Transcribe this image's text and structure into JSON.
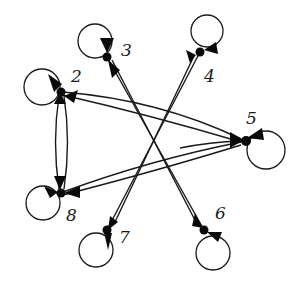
{
  "diagram": {
    "type": "directed-graph",
    "nodes": [
      {
        "id": "2",
        "label": "2"
      },
      {
        "id": "3",
        "label": "3"
      },
      {
        "id": "4",
        "label": "4"
      },
      {
        "id": "5",
        "label": "5"
      },
      {
        "id": "6",
        "label": "6"
      },
      {
        "id": "7",
        "label": "7"
      },
      {
        "id": "8",
        "label": "8"
      }
    ],
    "edges": [
      {
        "from": "2",
        "to": "2",
        "kind": "self-loop"
      },
      {
        "from": "3",
        "to": "3",
        "kind": "self-loop"
      },
      {
        "from": "4",
        "to": "4",
        "kind": "self-loop"
      },
      {
        "from": "5",
        "to": "5",
        "kind": "self-loop"
      },
      {
        "from": "6",
        "to": "6",
        "kind": "self-loop"
      },
      {
        "from": "7",
        "to": "7",
        "kind": "self-loop"
      },
      {
        "from": "8",
        "to": "8",
        "kind": "self-loop"
      },
      {
        "from": "2",
        "to": "8"
      },
      {
        "from": "8",
        "to": "2"
      },
      {
        "from": "2",
        "to": "5"
      },
      {
        "from": "5",
        "to": "2"
      },
      {
        "from": "8",
        "to": "5"
      },
      {
        "from": "5",
        "to": "8"
      },
      {
        "from": "3",
        "to": "6"
      },
      {
        "from": "6",
        "to": "3"
      },
      {
        "from": "4",
        "to": "7"
      },
      {
        "from": "7",
        "to": "4"
      }
    ]
  }
}
